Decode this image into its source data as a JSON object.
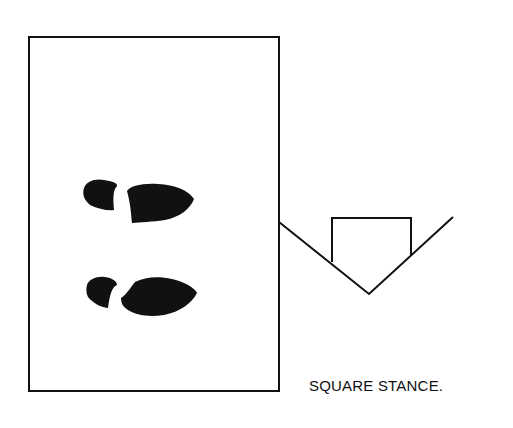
{
  "diagram": {
    "title": "Square Stance",
    "caption": "SQUARE STANCE.",
    "colors": {
      "ink": "#111111",
      "background": "#ffffff"
    },
    "elements": {
      "batters_box": "rectangle representing the batter's box",
      "footprints": [
        "front-foot-print",
        "back-foot-print"
      ],
      "home_plate": "pentagon home plate with foul lines"
    }
  }
}
